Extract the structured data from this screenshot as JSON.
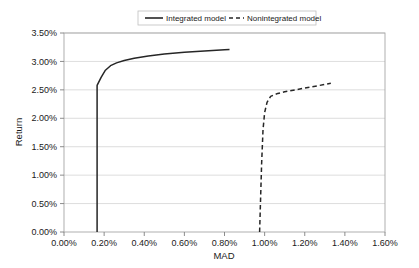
{
  "chart_data": {
    "type": "line",
    "title": "",
    "xlabel": "MAD",
    "ylabel": "Return",
    "xlim": [
      0.0,
      1.6
    ],
    "ylim": [
      0.0,
      3.5
    ],
    "x_tick_labels": [
      "0.00%",
      "0.20%",
      "0.40%",
      "0.60%",
      "0.80%",
      "1.00%",
      "1.20%",
      "1.40%",
      "1.60%"
    ],
    "x_tick_values": [
      0.0,
      0.2,
      0.4,
      0.6,
      0.8,
      1.0,
      1.2,
      1.4,
      1.6
    ],
    "y_tick_labels": [
      "0.00%",
      "0.50%",
      "1.00%",
      "1.50%",
      "2.00%",
      "2.50%",
      "3.00%",
      "3.50%"
    ],
    "y_tick_values": [
      0.0,
      0.5,
      1.0,
      1.5,
      2.0,
      2.5,
      3.0,
      3.5
    ],
    "grid": "horizontal",
    "legend_position": "top-center",
    "series": [
      {
        "name": "Integrated model",
        "style": "solid",
        "color": "#262626",
        "points": [
          [
            0.165,
            0.0
          ],
          [
            0.165,
            2.58
          ],
          [
            0.185,
            2.72
          ],
          [
            0.205,
            2.84
          ],
          [
            0.232,
            2.925
          ],
          [
            0.262,
            2.975
          ],
          [
            0.3,
            3.015
          ],
          [
            0.35,
            3.055
          ],
          [
            0.42,
            3.095
          ],
          [
            0.5,
            3.13
          ],
          [
            0.6,
            3.16
          ],
          [
            0.7,
            3.185
          ],
          [
            0.8,
            3.205
          ],
          [
            0.825,
            3.21
          ]
        ]
      },
      {
        "name": "Nonintegrated model",
        "style": "dashed",
        "color": "#262626",
        "points": [
          [
            0.975,
            0.0
          ],
          [
            0.98,
            0.6
          ],
          [
            0.985,
            1.2
          ],
          [
            0.992,
            1.8
          ],
          [
            1.0,
            2.1
          ],
          [
            1.012,
            2.28
          ],
          [
            1.03,
            2.385
          ],
          [
            1.06,
            2.43
          ],
          [
            1.1,
            2.465
          ],
          [
            1.16,
            2.505
          ],
          [
            1.23,
            2.55
          ],
          [
            1.3,
            2.595
          ],
          [
            1.33,
            2.615
          ]
        ]
      }
    ]
  },
  "legend": {
    "items": [
      {
        "label": "Integrated model",
        "style": "solid"
      },
      {
        "label": "Nonintegrated model",
        "style": "dashed"
      }
    ]
  }
}
